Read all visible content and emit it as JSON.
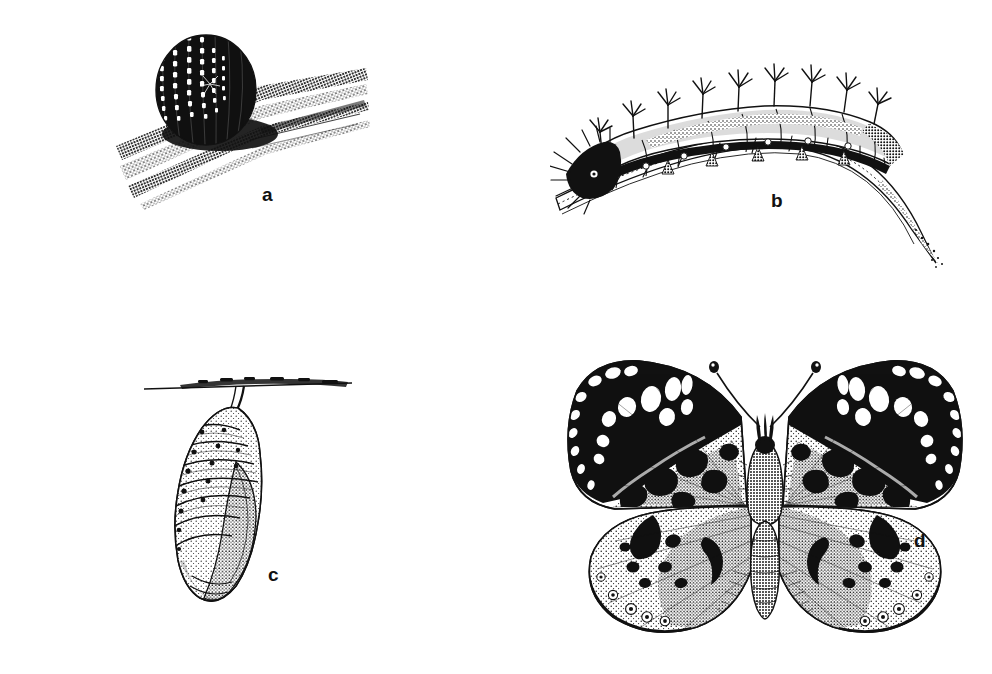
{
  "figure": {
    "background_color": "#ffffff",
    "ink_color": "#111111",
    "panel_count": 4
  },
  "panels": [
    {
      "id": "a",
      "label": "a",
      "name": "egg-on-leaf",
      "subject": "butterfly egg",
      "stage": "egg",
      "caption": "Ribbed, barrel-shaped egg resting on a leaf blade",
      "details": "Vertically ribbed ovum with beaded surface texture set on diagonal stippled leaf bands"
    },
    {
      "id": "b",
      "label": "b",
      "name": "caterpillar-on-leaf",
      "subject": "spiny caterpillar larva",
      "stage": "larva",
      "caption": "Spiny larva feeding along the curve of a leaf",
      "details": "Segmented caterpillar bearing branched spines (scoli) on each segment, dark head at left, arched leaf tapering to a point at lower right"
    },
    {
      "id": "c",
      "label": "c",
      "name": "chrysalis-hanging",
      "subject": "chrysalis pupa",
      "stage": "pupa",
      "caption": "Chrysalis suspended by its cremaster from a twig",
      "details": "Pendant pupa with banded abdominal segments, dark tubercle dots and smooth stippled wing cases"
    },
    {
      "id": "d",
      "label": "d",
      "name": "adult-butterfly",
      "subject": "adult butterfly",
      "stage": "adult",
      "caption": "Adult butterfly with wings fully spread, dorsal view",
      "details": "Painted-lady type nymphalid; black forewing apex with white spots, mottled black blotches on stippled ground, hindwings with submarginal eyespots, clubbed antennae and furry thorax"
    }
  ],
  "colors": {
    "ink": "#111111",
    "paper": "#ffffff",
    "stipple": "#1a1a1a"
  }
}
